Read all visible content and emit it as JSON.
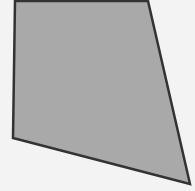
{
  "diagram": {
    "type": "quadrilateral",
    "vertices": [
      [
        15,
        1
      ],
      [
        148,
        1
      ],
      [
        190,
        184
      ],
      [
        13,
        138
      ]
    ],
    "fill": "#a9a9a9",
    "stroke": "#333333",
    "stroke_width": 2.5,
    "background": "#f3f3f3"
  }
}
